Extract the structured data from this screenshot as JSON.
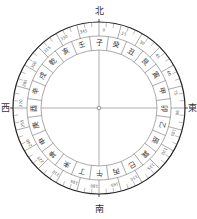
{
  "diagram": {
    "title": "",
    "center": {
      "x": 99,
      "y": 108
    },
    "radii": {
      "outer": 86,
      "tick_inner": 81,
      "degree_band_inner": 72,
      "mountain_outer": 72,
      "mountain_inner": 58
    },
    "colors": {
      "line": "#555555",
      "outer_ring": "#222222",
      "text": "#333333",
      "background": "#ffffff"
    },
    "cardinals": {
      "north": "北",
      "east": "東",
      "south": "南",
      "west": "西"
    },
    "degree_labels": [
      "0",
      "15",
      "30",
      "45",
      "60",
      "75",
      "90",
      "105",
      "120",
      "135",
      "150",
      "165",
      "180",
      "195",
      "210",
      "225",
      "240",
      "255",
      "270",
      "285",
      "300",
      "315",
      "330",
      "345"
    ],
    "mountains": [
      {
        "name": "子",
        "angle": 0
      },
      {
        "name": "癸",
        "angle": 15
      },
      {
        "name": "丑",
        "angle": 30
      },
      {
        "name": "艮",
        "angle": 45
      },
      {
        "name": "寅",
        "angle": 60
      },
      {
        "name": "甲",
        "angle": 75
      },
      {
        "name": "卯",
        "angle": 90
      },
      {
        "name": "乙",
        "angle": 105
      },
      {
        "name": "辰",
        "angle": 120
      },
      {
        "name": "巽",
        "angle": 135
      },
      {
        "name": "巳",
        "angle": 150
      },
      {
        "name": "丙",
        "angle": 165
      },
      {
        "name": "午",
        "angle": 180
      },
      {
        "name": "丁",
        "angle": 195
      },
      {
        "name": "未",
        "angle": 210
      },
      {
        "name": "坤",
        "angle": 225
      },
      {
        "name": "申",
        "angle": 240
      },
      {
        "name": "庚",
        "angle": 255
      },
      {
        "name": "酉",
        "angle": 270
      },
      {
        "name": "辛",
        "angle": 285
      },
      {
        "name": "戌",
        "angle": 300
      },
      {
        "name": "乾",
        "angle": 315
      },
      {
        "name": "亥",
        "angle": 330
      },
      {
        "name": "壬",
        "angle": 345
      }
    ]
  }
}
